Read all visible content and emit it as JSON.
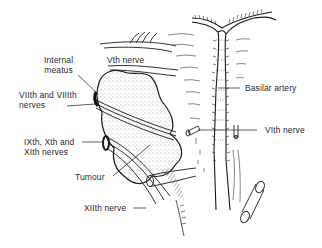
{
  "figure": {
    "type": "anatomical illustration"
  },
  "labels": {
    "internal_meatus_line1": "Internal",
    "internal_meatus_line2": "meatus",
    "vth_nerve": "Vth nerve",
    "viith_viiith_line1": "VIIth and VIIIth",
    "viith_viiith_line2": "nerves",
    "basilar_artery": "Basilar artery",
    "vith_nerve": "VIth nerve",
    "ixth_xth_xith_line1": "IXth, Xth and",
    "ixth_xth_xith_line2": "XIth nerves",
    "tumour": "Tumour",
    "xiith_nerve": "XIIth nerve"
  },
  "colors": {
    "ink": "#1a1a1a",
    "stipple": "#555555",
    "background": "#ffffff"
  }
}
